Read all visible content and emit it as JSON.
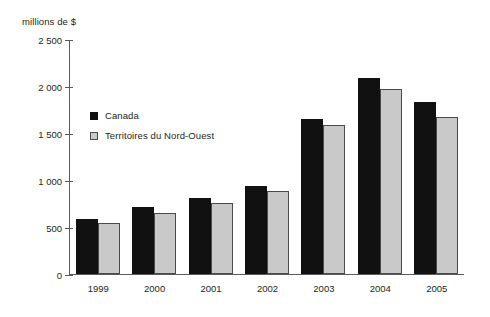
{
  "chart_data": {
    "type": "bar",
    "title": "",
    "subtitle": "",
    "xlabel": "",
    "ylabel": "millions de $",
    "categories": [
      "1999",
      "2000",
      "2001",
      "2002",
      "2003",
      "2004",
      "2005"
    ],
    "series": [
      {
        "name": "Canada",
        "color": "#111111",
        "values": [
          585,
          710,
          810,
          935,
          1650,
          2080,
          1830
        ]
      },
      {
        "name": "Territoires du Nord-Ouest",
        "color": "#c9c9c9",
        "values": [
          540,
          650,
          760,
          880,
          1580,
          1965,
          1670
        ]
      }
    ],
    "ylim": [
      0,
      2500
    ],
    "yticks": [
      0,
      500,
      1000,
      1500,
      2000,
      2500
    ],
    "ytick_labels": [
      "0",
      "500",
      "1 000",
      "1 500",
      "2 000",
      "2 500"
    ],
    "grid": false,
    "legend_position": "inside-upper-left"
  }
}
